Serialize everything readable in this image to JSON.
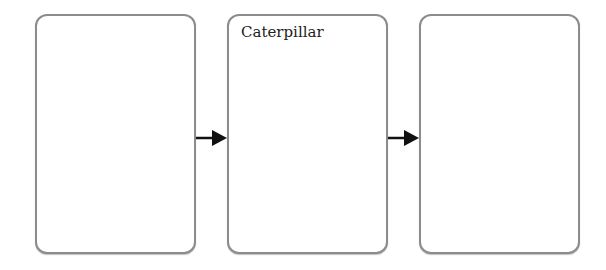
{
  "diagram": {
    "type": "sequence-flow",
    "boxes": [
      {
        "label": ""
      },
      {
        "label": "Caterpillar"
      },
      {
        "label": ""
      }
    ],
    "arrows": [
      {
        "from": 0,
        "to": 1
      },
      {
        "from": 1,
        "to": 2
      }
    ],
    "colors": {
      "border": "#8c8c8c",
      "arrow": "#111111"
    }
  }
}
